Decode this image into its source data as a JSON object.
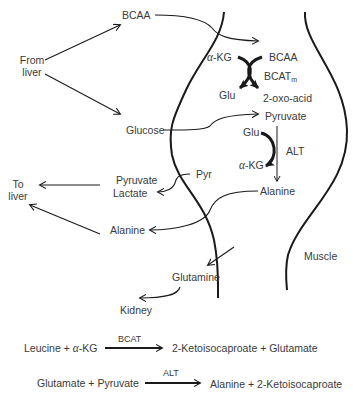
{
  "diagram": {
    "sources": {
      "from_liver": [
        "From",
        "liver"
      ],
      "to_liver": [
        "To",
        "liver"
      ]
    },
    "blood": {
      "bcaa": "BCAA",
      "glucose": "Glucose",
      "pyruvate": "Pyruvate",
      "lactate": "Lactate",
      "alanine": "Alanine",
      "glutamine": "Glutamine",
      "kidney": "Kidney"
    },
    "muscle": {
      "label": "Muscle",
      "bcaa": "BCAA",
      "alpha_kg_1": "-KG",
      "alpha_symbol": "α",
      "bcat_main": "BCAT",
      "bcat_sub": "m",
      "glu_1": "Glu",
      "oxo_acid": "2-oxo-acid",
      "pyruvate": "Pyruvate",
      "glu_2": "Glu",
      "alt": "ALT",
      "alpha_kg_2": "-KG",
      "alanine": "Alanine",
      "pyr": "Pyr"
    },
    "equations": [
      {
        "left_a": "Leucine + ",
        "left_greek": "α",
        "left_b": "-KG",
        "enzyme": "BCAT",
        "right": "2-Ketoisocaproate + Glutamate"
      },
      {
        "left_a": "Glutamate + Pyruvate",
        "left_greek": "",
        "left_b": "",
        "enzyme": "ALT",
        "right": "Alanine + 2-Ketoisocaproate"
      }
    ]
  },
  "colors": {
    "ink": "#1a1a1a",
    "text": "#3a3a3a",
    "background": "#ffffff"
  }
}
